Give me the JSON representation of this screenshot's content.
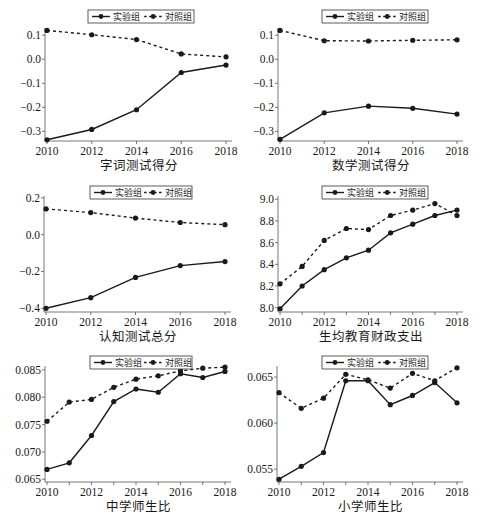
{
  "legend": {
    "treatment_label": "实验组",
    "control_label": "对照组"
  },
  "colors": {
    "line": "#1a1a1a",
    "background": "#ffffff"
  },
  "chart_data": [
    {
      "type": "line",
      "title": "字词测试得分",
      "xlabel": "字词测试得分",
      "ylabel": "",
      "x": [
        2010,
        2012,
        2014,
        2016,
        2018
      ],
      "x_ticks": [
        "2010",
        "2012",
        "2014",
        "2016",
        "2018"
      ],
      "y_ticks": [
        "0.1",
        "0.0",
        "−0.1",
        "−0.2",
        "−0.3"
      ],
      "y_tick_values": [
        0.1,
        0.0,
        -0.1,
        -0.2,
        -0.3
      ],
      "ylim": [
        -0.34,
        0.13
      ],
      "series": [
        {
          "name": "实验组",
          "style": "solid",
          "values": [
            -0.335,
            -0.292,
            -0.21,
            -0.055,
            -0.024
          ]
        },
        {
          "name": "对照组",
          "style": "dashed",
          "values": [
            0.12,
            0.102,
            0.082,
            0.022,
            0.01
          ]
        }
      ],
      "legend_position": "top-right",
      "grid": false,
      "box": {
        "left": 45,
        "top": 28,
        "right": 232,
        "bottom": 141
      },
      "legend_box": {
        "x": 88,
        "y": 10,
        "w": 106,
        "h": 13
      }
    },
    {
      "type": "line",
      "title": "数学测试得分",
      "xlabel": "数学测试得分",
      "ylabel": "",
      "x": [
        2010,
        2012,
        2014,
        2016,
        2018
      ],
      "x_ticks": [
        "2010",
        "2012",
        "2014",
        "2016",
        "2018"
      ],
      "y_ticks": [
        "0.1",
        "0.0",
        "−0.1",
        "−0.2",
        "−0.3"
      ],
      "y_tick_values": [
        0.1,
        0.0,
        -0.1,
        -0.2,
        -0.3
      ],
      "ylim": [
        -0.34,
        0.13
      ],
      "series": [
        {
          "name": "实验组",
          "style": "solid",
          "values": [
            -0.333,
            -0.223,
            -0.195,
            -0.204,
            -0.228
          ]
        },
        {
          "name": "对照组",
          "style": "dashed",
          "values": [
            0.12,
            0.077,
            0.076,
            0.079,
            0.081
          ]
        }
      ],
      "legend_position": "top-right",
      "grid": false,
      "box": {
        "left": 278,
        "top": 28,
        "right": 463,
        "bottom": 141
      },
      "legend_box": {
        "x": 322,
        "y": 10,
        "w": 106,
        "h": 13
      }
    },
    {
      "type": "line",
      "title": "认知测试总分",
      "xlabel": "认知测试总分",
      "ylabel": "",
      "x": [
        2010,
        2012,
        2014,
        2016,
        2018
      ],
      "x_ticks": [
        "2010",
        "2012",
        "2014",
        "2016",
        "2018"
      ],
      "y_ticks": [
        "0.2",
        "0.0",
        "−0.2",
        "−0.4"
      ],
      "y_tick_values": [
        0.2,
        0.0,
        -0.2,
        -0.4
      ],
      "ylim": [
        -0.42,
        0.21
      ],
      "series": [
        {
          "name": "实验组",
          "style": "solid",
          "values": [
            -0.4,
            -0.342,
            -0.232,
            -0.168,
            -0.146
          ]
        },
        {
          "name": "对照组",
          "style": "dashed",
          "values": [
            0.14,
            0.12,
            0.09,
            0.066,
            0.054
          ]
        }
      ],
      "legend_position": "top-right",
      "grid": false,
      "box": {
        "left": 44,
        "top": 196,
        "right": 231,
        "bottom": 312
      },
      "legend_box": {
        "x": 90,
        "y": 186,
        "w": 102,
        "h": 13
      }
    },
    {
      "type": "line",
      "title": "生均教育财政支出",
      "xlabel": "生均教育财政支出",
      "ylabel": "",
      "x": [
        2010,
        2011,
        2012,
        2013,
        2014,
        2015,
        2016,
        2017,
        2018
      ],
      "x_ticks": [
        "2010",
        "2012",
        "2014",
        "2016",
        "2018"
      ],
      "y_ticks": [
        "9.0",
        "8.8",
        "8.6",
        "8.4",
        "8.2",
        "8.0"
      ],
      "y_tick_values": [
        9.0,
        8.8,
        8.6,
        8.4,
        8.2,
        8.0
      ],
      "ylim": [
        7.96,
        9.03
      ],
      "series": [
        {
          "name": "实验组",
          "style": "solid",
          "values": [
            7.99,
            8.2,
            8.35,
            8.46,
            8.53,
            8.69,
            8.77,
            8.85,
            8.9
          ]
        },
        {
          "name": "对照组",
          "style": "dashed",
          "values": [
            8.22,
            8.38,
            8.62,
            8.73,
            8.72,
            8.85,
            8.9,
            8.96,
            8.85
          ]
        }
      ],
      "legend_position": "top-right",
      "grid": false,
      "box": {
        "left": 278,
        "top": 196,
        "right": 463,
        "bottom": 312
      },
      "legend_box": {
        "x": 322,
        "y": 186,
        "w": 106,
        "h": 13
      }
    },
    {
      "type": "line",
      "title": "中学师生比",
      "xlabel": "中学师生比",
      "ylabel": "",
      "x": [
        2010,
        2011,
        2012,
        2013,
        2014,
        2015,
        2016,
        2017,
        2018
      ],
      "x_ticks": [
        "2010",
        "2012",
        "2014",
        "2016",
        "2018"
      ],
      "y_ticks": [
        "0.085",
        "0.080",
        "0.075",
        "0.070",
        "0.065"
      ],
      "y_tick_values": [
        0.085,
        0.08,
        0.075,
        0.07,
        0.065
      ],
      "ylim": [
        0.0645,
        0.0857
      ],
      "series": [
        {
          "name": "实验组",
          "style": "solid",
          "values": [
            0.0668,
            0.068,
            0.073,
            0.0792,
            0.0815,
            0.0809,
            0.0843,
            0.0836,
            0.0847
          ]
        },
        {
          "name": "对照组",
          "style": "dashed",
          "values": [
            0.0756,
            0.0791,
            0.0796,
            0.0818,
            0.0833,
            0.0839,
            0.0848,
            0.0853,
            0.0855
          ]
        }
      ],
      "legend_position": "top-right",
      "grid": false,
      "box": {
        "left": 45,
        "top": 366,
        "right": 231,
        "bottom": 482
      },
      "legend_box": {
        "x": 90,
        "y": 356,
        "w": 102,
        "h": 13
      }
    },
    {
      "type": "line",
      "title": "小学师生比",
      "xlabel": "小学师生比",
      "ylabel": "",
      "x": [
        2010,
        2011,
        2012,
        2013,
        2014,
        2015,
        2016,
        2017,
        2018
      ],
      "x_ticks": [
        "2010",
        "2012",
        "2014",
        "2016",
        "2018"
      ],
      "y_ticks": [
        "0.065",
        "0.060",
        "0.055"
      ],
      "y_tick_values": [
        0.065,
        0.06,
        0.055
      ],
      "ylim": [
        0.0536,
        0.0662
      ],
      "series": [
        {
          "name": "实验组",
          "style": "solid",
          "values": [
            0.0539,
            0.0553,
            0.0568,
            0.0646,
            0.0646,
            0.062,
            0.063,
            0.0644,
            0.0622
          ]
        },
        {
          "name": "对照组",
          "style": "dashed",
          "values": [
            0.0633,
            0.0616,
            0.0627,
            0.0653,
            0.0647,
            0.0638,
            0.0654,
            0.0646,
            0.066
          ]
        }
      ],
      "legend_position": "top-right",
      "grid": false,
      "box": {
        "left": 277,
        "top": 366,
        "right": 463,
        "bottom": 482
      },
      "legend_box": {
        "x": 322,
        "y": 356,
        "w": 106,
        "h": 13
      }
    }
  ]
}
